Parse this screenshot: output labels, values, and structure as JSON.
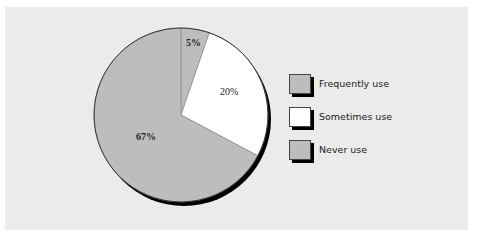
{
  "chart_data": {
    "type": "pie",
    "title": "",
    "categories": [
      "Frequently use",
      "Sometimes use",
      "Never use"
    ],
    "values": [
      5,
      20,
      67
    ],
    "labels": [
      "5%",
      "20%",
      "67%"
    ],
    "colors": [
      "#bdbdbd",
      "#ffffff",
      "#bdbdbd"
    ],
    "legend_position": "right",
    "note": "Displayed percentages sum to 92%"
  },
  "slices": [
    {
      "label": "5%",
      "color": "#bdbdbd",
      "start_deg": 0,
      "end_deg": 19
    },
    {
      "label": "20%",
      "color": "#ffffff",
      "start_deg": 19,
      "end_deg": 118
    },
    {
      "label": "67%",
      "color": "#bdbdbd",
      "start_deg": 118,
      "end_deg": 360
    }
  ],
  "legend": {
    "items": [
      {
        "label": "Frequently use",
        "color": "#bdbdbd"
      },
      {
        "label": "Sometimes use",
        "color": "#ffffff"
      },
      {
        "label": "Never use",
        "color": "#bdbdbd"
      }
    ]
  },
  "colors": {
    "background": "#ebebeb",
    "outline": "#333333",
    "shadow": "#000000"
  }
}
